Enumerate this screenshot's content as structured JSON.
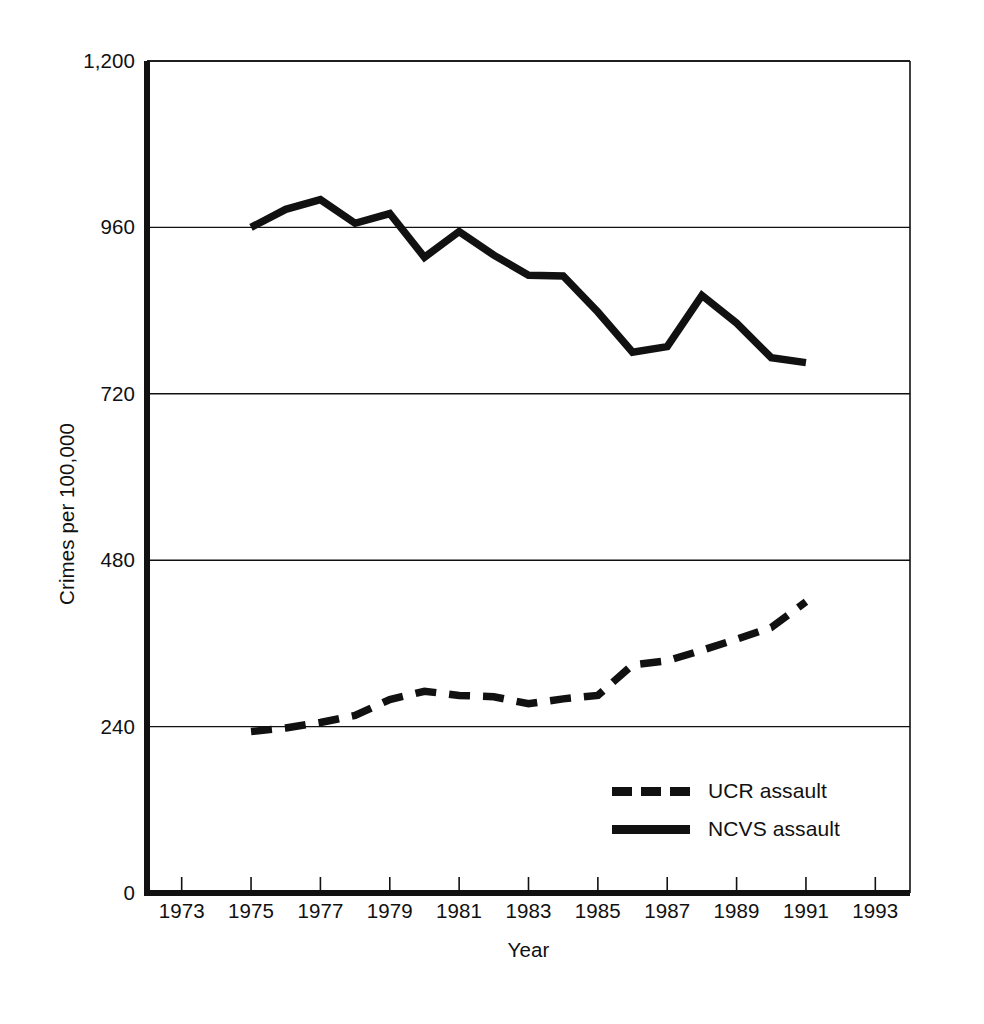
{
  "chart_data": {
    "type": "line",
    "title": "",
    "subtitle": "",
    "xlabel": "Year",
    "ylabel": "Crimes per 100,000",
    "xlim": [
      1972,
      1994
    ],
    "ylim": [
      0,
      1200
    ],
    "grid": "horizontal",
    "legend_position": "inside-bottom-right",
    "x_ticks": [
      1973,
      1975,
      1977,
      1979,
      1981,
      1983,
      1985,
      1987,
      1989,
      1991,
      1993
    ],
    "x_tick_labels": [
      "1973",
      "1975",
      "1977",
      "1979",
      "1981",
      "1983",
      "1985",
      "1987",
      "1989",
      "1991",
      "1993"
    ],
    "y_ticks": [
      0,
      240,
      480,
      720,
      960,
      1200
    ],
    "y_tick_labels": [
      "0",
      "240",
      "480",
      "720",
      "960",
      "1,200"
    ],
    "series": [
      {
        "name": "UCR assault",
        "style": "dashed",
        "color": "#111111",
        "x": [
          1975,
          1976,
          1977,
          1978,
          1979,
          1980,
          1981,
          1982,
          1983,
          1984,
          1985,
          1986,
          1987,
          1988,
          1989,
          1990,
          1991
        ],
        "values": [
          233,
          238,
          246,
          256,
          279,
          291,
          285,
          283,
          273,
          280,
          285,
          329,
          335,
          350,
          366,
          383,
          420
        ]
      },
      {
        "name": "NCVS assault",
        "style": "solid",
        "color": "#111111",
        "x": [
          1975,
          1976,
          1977,
          1978,
          1979,
          1980,
          1981,
          1982,
          1983,
          1984,
          1985,
          1986,
          1987,
          1988,
          1989,
          1990,
          1991
        ],
        "values": [
          960,
          986,
          1000,
          966,
          980,
          917,
          954,
          920,
          891,
          890,
          838,
          780,
          788,
          862,
          822,
          772,
          765
        ]
      }
    ]
  },
  "legend": {
    "items": [
      {
        "label": "UCR assault",
        "style": "dashed"
      },
      {
        "label": "NCVS assault",
        "style": "solid"
      }
    ]
  },
  "axes": {
    "x_title": "Year",
    "y_title": "Crimes per 100,000"
  }
}
